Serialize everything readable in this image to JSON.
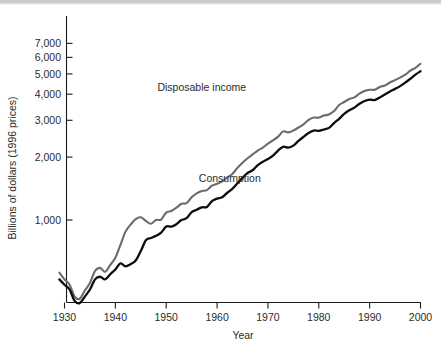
{
  "chart_data": {
    "type": "line",
    "title": "",
    "xlabel": "Year",
    "ylabel": "Billions of dollars (1996 prices)",
    "yscale": "log",
    "xlim": [
      1929,
      2000
    ],
    "ylim": [
      380,
      7400
    ],
    "grid": false,
    "legend_position": "inline-annotations",
    "xticks": [
      "1930",
      "1940",
      "1950",
      "1960",
      "1970",
      "1980",
      "1990",
      "2000"
    ],
    "xtick_values": [
      1930,
      1940,
      1950,
      1960,
      1970,
      1980,
      1990,
      2000
    ],
    "yticks": [
      "1,000",
      "2,000",
      "3,000",
      "4,000",
      "5,000",
      "6,000",
      "7,000"
    ],
    "ytick_values": [
      1000,
      2000,
      3000,
      4000,
      5000,
      6000,
      7000
    ],
    "colors": {
      "disposable_income": "#6b6b6b",
      "consumption": "#0d0d0d",
      "axis": "#1a1a1a",
      "text": "#2b2b2b",
      "background": "#ffffff"
    },
    "annotations": [
      {
        "text": "Disposable income",
        "x": 1957.0,
        "y": 4150
      },
      {
        "text": "Consumption",
        "x": 1962.5,
        "y": 1520
      }
    ],
    "x": [
      1929,
      1930,
      1931,
      1932,
      1933,
      1934,
      1935,
      1936,
      1937,
      1938,
      1939,
      1940,
      1941,
      1942,
      1943,
      1944,
      1945,
      1946,
      1947,
      1948,
      1949,
      1950,
      1951,
      1952,
      1953,
      1954,
      1955,
      1956,
      1957,
      1958,
      1959,
      1960,
      1961,
      1962,
      1963,
      1964,
      1965,
      1966,
      1967,
      1968,
      1969,
      1970,
      1971,
      1972,
      1973,
      1974,
      1975,
      1976,
      1977,
      1978,
      1979,
      1980,
      1981,
      1982,
      1983,
      1984,
      1985,
      1986,
      1987,
      1988,
      1989,
      1990,
      1991,
      1992,
      1993,
      1994,
      1995,
      1996,
      1997,
      1998,
      1999,
      2000
    ],
    "series": [
      {
        "name": "Disposable income",
        "color": "#6b6b6b",
        "values": [
          560,
          520,
          490,
          430,
          420,
          460,
          500,
          570,
          590,
          565,
          610,
          660,
          760,
          880,
          950,
          1010,
          1030,
          990,
          960,
          1000,
          1005,
          1085,
          1105,
          1145,
          1195,
          1205,
          1285,
          1340,
          1375,
          1390,
          1460,
          1490,
          1530,
          1600,
          1660,
          1775,
          1880,
          1975,
          2060,
          2150,
          2220,
          2320,
          2405,
          2505,
          2655,
          2625,
          2680,
          2770,
          2865,
          3010,
          3090,
          3090,
          3160,
          3200,
          3320,
          3550,
          3670,
          3790,
          3860,
          4020,
          4140,
          4200,
          4200,
          4330,
          4400,
          4550,
          4670,
          4800,
          4960,
          5180,
          5350,
          5590
        ]
      },
      {
        "name": "Consumption",
        "color": "#0d0d0d",
        "values": [
          520,
          490,
          465,
          410,
          400,
          430,
          465,
          520,
          535,
          520,
          550,
          580,
          620,
          600,
          615,
          640,
          710,
          800,
          820,
          840,
          870,
          930,
          930,
          955,
          1000,
          1020,
          1090,
          1120,
          1150,
          1155,
          1230,
          1265,
          1285,
          1350,
          1410,
          1500,
          1590,
          1680,
          1730,
          1830,
          1900,
          1960,
          2030,
          2150,
          2240,
          2220,
          2270,
          2390,
          2500,
          2610,
          2680,
          2670,
          2710,
          2760,
          2910,
          3050,
          3220,
          3350,
          3450,
          3600,
          3710,
          3770,
          3750,
          3860,
          3990,
          4120,
          4240,
          4370,
          4540,
          4740,
          4960,
          5150
        ]
      }
    ]
  }
}
